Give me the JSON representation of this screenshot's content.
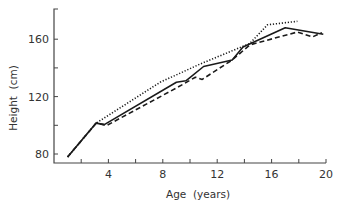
{
  "chart_data": {
    "type": "line",
    "title": "",
    "xlabel": "Age  (years)",
    "ylabel": "Height  (cm)",
    "xlim": [
      0,
      20
    ],
    "ylim": [
      75,
      180
    ],
    "x_ticks": [
      2,
      4,
      6,
      8,
      10,
      12,
      14,
      16,
      18,
      20
    ],
    "x_tick_labels": [
      "",
      "4",
      "",
      "8",
      "",
      "12",
      "",
      "16",
      "",
      "20"
    ],
    "y_ticks": [
      80,
      100,
      120,
      140,
      160
    ],
    "y_tick_labels": [
      "80",
      "",
      "120",
      "",
      "160"
    ],
    "grid": false,
    "legend": null,
    "series": [
      {
        "name": "solid",
        "style": "solid",
        "points": [
          [
            1.0,
            78
          ],
          [
            3.1,
            101.5
          ],
          [
            3.7,
            100.5
          ],
          [
            9.0,
            130
          ],
          [
            9.7,
            131
          ],
          [
            11.0,
            141
          ],
          [
            13.1,
            145.5
          ],
          [
            13.9,
            154.5
          ],
          [
            17.0,
            168
          ],
          [
            19.8,
            163.5
          ]
        ]
      },
      {
        "name": "dotted",
        "style": "dotted",
        "points": [
          [
            1.0,
            78
          ],
          [
            3.1,
            101.5
          ],
          [
            7.8,
            130
          ],
          [
            10.7,
            142.5
          ],
          [
            14.4,
            157
          ],
          [
            15.7,
            170
          ],
          [
            17.9,
            172.5
          ]
        ]
      },
      {
        "name": "dashed",
        "style": "dashed",
        "points": [
          [
            1.0,
            78
          ],
          [
            3.1,
            101.5
          ],
          [
            3.9,
            100
          ],
          [
            9.0,
            126
          ],
          [
            10.4,
            133.5
          ],
          [
            10.9,
            132
          ],
          [
            13.1,
            145.5
          ],
          [
            14.4,
            156
          ],
          [
            17.9,
            165
          ],
          [
            19.0,
            161.5
          ],
          [
            19.7,
            164.5
          ]
        ]
      }
    ]
  },
  "layout": {
    "plot": {
      "x0": 54,
      "x1": 326,
      "y_axis_top": 9,
      "x_axis_y": 163
    },
    "px_per_year": 13.6,
    "height_origin_cm": 80,
    "height_origin_px": 154,
    "px_per_cm": 1.435,
    "line_color": "#1a1a1a",
    "axis_color": "#444444"
  }
}
